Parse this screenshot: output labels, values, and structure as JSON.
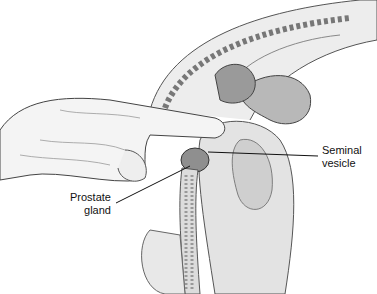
{
  "figure": {
    "labels": {
      "seminal_vesicle": [
        "Seminal",
        "vesicle"
      ],
      "prostate_gland": [
        "Prostate",
        "gland"
      ]
    }
  }
}
